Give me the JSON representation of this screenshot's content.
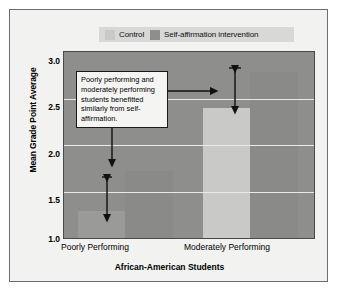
{
  "chart_data": {
    "type": "bar",
    "title": "",
    "xlabel": "African-American Students",
    "ylabel": "Mean Grade Point Average",
    "categories": [
      "Poorly Performing",
      "Moderately Performing"
    ],
    "series": [
      {
        "name": "Control",
        "values": [
          1.29,
          2.4
        ],
        "color": "#c9c9c7"
      },
      {
        "name": "Self-affirmation intervention",
        "values": [
          1.72,
          2.78
        ],
        "color": "#8a8a88"
      }
    ],
    "ylim": [
      1.0,
      3.0
    ],
    "yticks": [
      "3.0",
      "2.5",
      "2.0",
      "1.5",
      "1.0"
    ],
    "ytick_values": [
      3.0,
      2.5,
      2.0,
      1.5,
      1.0
    ],
    "grid": true,
    "legend_position": "top",
    "annotations": [
      {
        "text": "Poorly performing and moderately performing students benefitted similarly from self-affirmation.",
        "kind": "callout-box"
      },
      {
        "kind": "effect-arrow",
        "group": "Poorly Performing",
        "from": 1.29,
        "to": 1.72
      },
      {
        "kind": "effect-arrow",
        "group": "Moderately Performing",
        "from": 2.4,
        "to": 2.78
      }
    ]
  },
  "legend": {
    "items": [
      {
        "label": "Control",
        "swatch": "control-swatch"
      },
      {
        "label": "Self-affirmation intervention",
        "swatch": "intervention-swatch"
      }
    ]
  },
  "axes": {
    "y_title": "Mean Grade Point Average",
    "x_title": "African-American Students",
    "y_ticks": [
      "3.0",
      "2.5",
      "2.0",
      "1.5",
      "1.0"
    ],
    "x_categories": [
      "Poorly Performing",
      "Moderately Performing"
    ]
  },
  "callout": {
    "text": "Poorly performing and moderately performing students benefitted similarly from self-affirmation."
  }
}
